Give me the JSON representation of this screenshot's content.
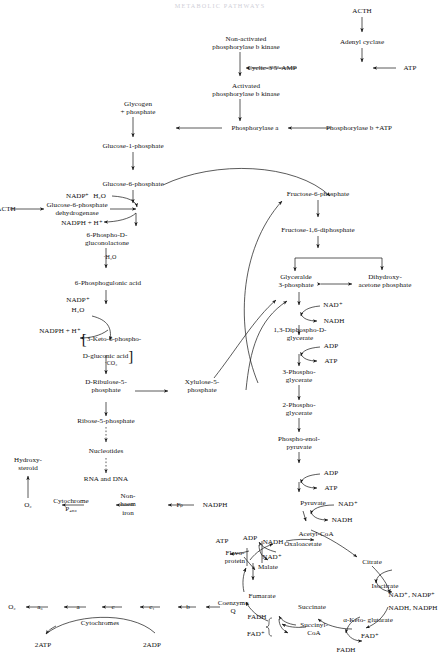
{
  "document": {
    "title_faint": "METABOLIC PATHWAYS",
    "domain": "biochemistry-pathway-diagram"
  },
  "nodes": {
    "acth_top": "ACTH",
    "adenyl_cyclase": "Adenyl cyclase",
    "atp_top": "ATP",
    "camp": "Cyclic-3′5′-AMP",
    "non_activated_kinase": "Non-activated\nphosphorylase b kinase",
    "activated_kinase": "Activated\nphosphorylase b kinase",
    "phosphorylase_b_atp": "Phosphorylase b +ATP",
    "phosphorylase_a": "Phosphorylase a",
    "glycogen": "Glycogen\n+ phosphate",
    "glucose_1_phosphate": "Glucose-1-phosphate",
    "glucose_6_phosphate": "Glucose-6-phosphate",
    "acth_left": "ACTH",
    "g6pdh": "Glucose-6-phosphate\ndehydrogenase",
    "nadp_h2o": "NADP⁺  H₂O",
    "nadph_h": "NADPH + H⁺",
    "gluconolactone": "6-Phospho-D-\ngluconolactone",
    "h2o_step": "·H₂O",
    "phosphogluconic": "6-Phosphogulonic acid",
    "nadp2": "NADP⁺",
    "h2o2": "H₂O",
    "nadph_h2": "NADPH + H⁺",
    "keto_gluconic": "3-Keto-6-phospho-\nD-gluconic acid",
    "co2": "·CO₂",
    "ribulose": "D-Ribulose-5-\nphosphate",
    "xylulose": "Xylulose-5-\nphosphate",
    "ribose": "Ribose-5-phosphate",
    "nucleotides": "Nucleotides",
    "rna_dna": "RNA and DNA",
    "fructose_6_p": "Fructose-6-phosphate",
    "fructose_16_dp": "Fructose-1,6-diphosphate",
    "glyceraldehyde": "Glyceralde\n3-phosphate",
    "dhap": "Dihydroxy-\nacetone phosphate",
    "nad_1": "NAD⁺",
    "nadh_1": "NADH",
    "diphosphoglycerate": "1,3-Diphospho-D-\nglycerate",
    "adp_1": "ADP",
    "atp_1": "ATP",
    "three_pg": "3-Phospho-\nglycerate",
    "two_pg": "2-Phospho-\nglycerate",
    "pep": "Phospho-enol-\npyruvate",
    "adp_2": "ADP",
    "atp_2": "ATP",
    "pyruvate": "Pyruvate",
    "nad_2": "NAD⁺",
    "nadh_2": "NADH",
    "acetyl_coa": "Acetyl-CoA",
    "oxaloacetate": "Oxaloacetate",
    "citrate": "Citrate",
    "isocitrate": "Isocitrate",
    "nad_nadp": "NAD⁺, NADP⁺",
    "nadh_nadph": "NADH, NADPH",
    "keto_glutarate": "α-Keto- glutarate",
    "fad_ring": "FAD⁺",
    "fadh_ring": "FADH",
    "succinyl_coa": "Succinyl-\nCoA",
    "succinate": "Succinate",
    "fadh_b": "FADH",
    "fad_b": "FAD⁺",
    "fumarate": "Fumarate",
    "malate": "Malate",
    "nadh_3": "NADH",
    "nad_3": "NAD⁺",
    "atp_3": "ATP",
    "adp_3": "ADP",
    "flavoprotein": "Flavo-\nprotein",
    "coenzyme_q": "Coenzyme\nQ",
    "nadph_etc": "NADPH",
    "fp": "Fₚ",
    "non_haem_iron": "Non-\nhaem\niron",
    "cytochrome_p450": "Cytochrome\nP₄₅₀",
    "o2_upper": "O₂",
    "hydroxy_steroid": "Hydroxy-\nsteroid",
    "o2_lower": "O₂",
    "cyt_a3": "a₃",
    "cyt_a": "a",
    "cyt_c": "c",
    "cyt_c1": "c₁",
    "cyt_b": "b",
    "cytochromes": "Cytochromes",
    "two_atp": "2ATP",
    "two_adp": "2ADP"
  },
  "colors": {
    "ink": "#111111",
    "line": "#1a1a1a",
    "faint_header": "#cfcfd8",
    "paper": "#ffffff"
  }
}
